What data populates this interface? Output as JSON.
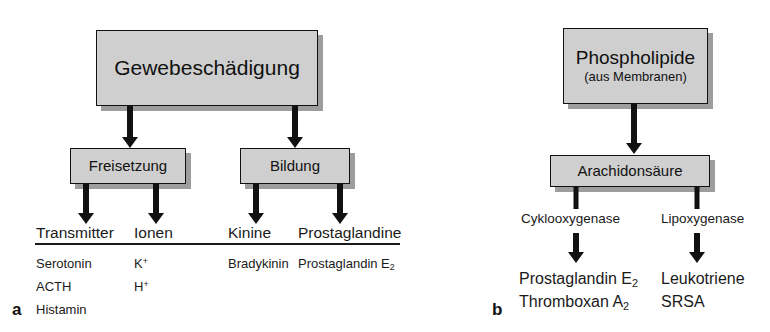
{
  "diagram": {
    "panel_a": {
      "letter": "a",
      "root_box": {
        "label": "Gewebeschädigung"
      },
      "branch_boxes": [
        {
          "label": "Freisetzung"
        },
        {
          "label": "Bildung"
        }
      ],
      "columns": [
        {
          "header": "Transmitter",
          "items": [
            "Serotonin",
            "ACTH",
            "Histamin"
          ]
        },
        {
          "header": "Ionen",
          "items_html": [
            "K<sup>+</sup>",
            "H<sup>+</sup>"
          ]
        },
        {
          "header": "Kinine",
          "items": [
            "Bradykinin"
          ]
        },
        {
          "header": "Prostaglandine",
          "items_html": [
            "Prostaglandin E<sub>2</sub>"
          ]
        }
      ]
    },
    "panel_b": {
      "letter": "b",
      "root_box": {
        "label": "Phospholipide",
        "sublabel": "(aus Membranen)"
      },
      "intermediate_box": {
        "label": "Arachidonsäure"
      },
      "pathways": [
        {
          "enzyme": "Cyklooxygenase",
          "products_html": [
            "Prostaglandin E<sub>2</sub>",
            "Thromboxan A<sub>2</sub>"
          ]
        },
        {
          "enzyme": "Lipoxygenase",
          "products_html": [
            "Leukotriene",
            "SRSA"
          ]
        }
      ]
    }
  },
  "colors": {
    "box_fill": "#cfcfcf",
    "box_border": "#111111",
    "shadow": "#8c8c8c",
    "text": "#1a1a1a",
    "background": "#ffffff"
  }
}
